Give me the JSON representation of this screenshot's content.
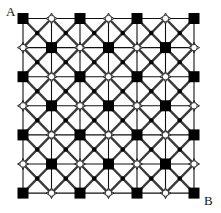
{
  "diagram": {
    "type": "lattice",
    "rows": 7,
    "cols": 7,
    "origin": [
      23,
      18.5
    ],
    "spacing": [
      28.5,
      29.1
    ],
    "corner_labels": {
      "start": {
        "text": "A",
        "x": 6,
        "y": 5
      },
      "end": {
        "text": "B",
        "x": 204,
        "y": 194
      }
    },
    "node_types": {
      "even": "filled-square",
      "odd": "open-node"
    },
    "center_marker": "small-dot",
    "colors": {
      "grid": "#111111",
      "diagonal": "#3a3a3a",
      "square": "#000000",
      "open_fill": "#ffffff",
      "dot": "#000000"
    }
  }
}
